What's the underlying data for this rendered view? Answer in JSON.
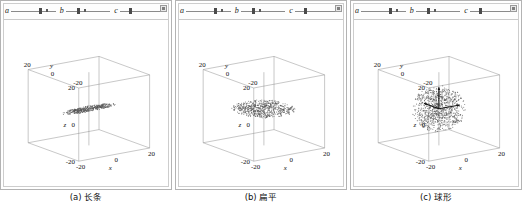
{
  "figure": {
    "panel_count": 3,
    "axis_ticks": [
      "-20",
      "0",
      "20"
    ],
    "axis_labels": {
      "x": "x",
      "y": "y",
      "z": "z"
    }
  },
  "panels": [
    {
      "id": "panel-a",
      "caption": "(a) 长条",
      "shape": "long-strip",
      "corner_button": "settings-icon",
      "sliders": [
        {
          "label": "a",
          "handle_pct": 62,
          "end_pct": 78
        },
        {
          "label": "b",
          "handle_pct": 26,
          "end_pct": 40
        },
        {
          "label": "c",
          "handle_pct": 20,
          "end_pct": 92
        }
      ],
      "axes": {
        "x": {
          "label": "x",
          "ticks": [
            "-20",
            "0",
            "20"
          ]
        },
        "y": {
          "label": "y",
          "ticks": [
            "-20",
            "0",
            "20"
          ]
        },
        "z": {
          "label": "z",
          "ticks": [
            "-20",
            "0",
            "20"
          ]
        }
      },
      "cloud": {
        "kind": "ellipsoid",
        "n_points": 420,
        "radii": [
          17.5,
          3.2,
          1.3
        ],
        "center": [
          0,
          0,
          0
        ],
        "show_vectors": false
      }
    },
    {
      "id": "panel-b",
      "caption": "(b) 扁平",
      "shape": "flat-disc",
      "corner_button": "settings-icon",
      "sliders": [
        {
          "label": "a",
          "handle_pct": 62,
          "end_pct": 78
        },
        {
          "label": "b",
          "handle_pct": 26,
          "end_pct": 40
        },
        {
          "label": "c",
          "handle_pct": 20,
          "end_pct": 92
        }
      ],
      "axes": {
        "x": {
          "label": "x",
          "ticks": [
            "-20",
            "0",
            "20"
          ]
        },
        "y": {
          "label": "y",
          "ticks": [
            "-20",
            "0",
            "20"
          ]
        },
        "z": {
          "label": "z",
          "ticks": [
            "-20",
            "0",
            "20"
          ]
        }
      },
      "cloud": {
        "kind": "ellipsoid",
        "n_points": 650,
        "radii": [
          16.5,
          16.5,
          2.2
        ],
        "center": [
          0,
          0,
          0
        ],
        "show_vectors": false
      }
    },
    {
      "id": "panel-c",
      "caption": "(c) 球形",
      "shape": "sphere",
      "corner_button": "settings-icon",
      "sliders": [
        {
          "label": "a",
          "handle_pct": 62,
          "end_pct": 78
        },
        {
          "label": "b",
          "handle_pct": 26,
          "end_pct": 40
        },
        {
          "label": "c",
          "handle_pct": 20,
          "end_pct": 92
        }
      ],
      "axes": {
        "x": {
          "label": "x",
          "ticks": [
            "-20",
            "0",
            "20"
          ]
        },
        "y": {
          "label": "y",
          "ticks": [
            "-20",
            "0",
            "20"
          ]
        },
        "z": {
          "label": "z",
          "ticks": [
            "-20",
            "0",
            "20"
          ]
        }
      },
      "cloud": {
        "kind": "ellipsoid",
        "n_points": 900,
        "radii": [
          13.5,
          13.5,
          13.5
        ],
        "center": [
          0,
          0,
          0
        ],
        "show_vectors": true,
        "vectors": [
          {
            "dir": [
              0,
              0,
              1
            ],
            "len": 13
          },
          {
            "dir": [
              1,
              0,
              0
            ],
            "len": 13
          },
          {
            "dir": [
              0,
              1,
              0
            ],
            "len": 13
          }
        ]
      }
    }
  ],
  "colors": {
    "point": "#555555",
    "frame": "#8d8d8d",
    "vector": "#111111",
    "panel_border": "#b3b3b3",
    "text": "#111111"
  }
}
